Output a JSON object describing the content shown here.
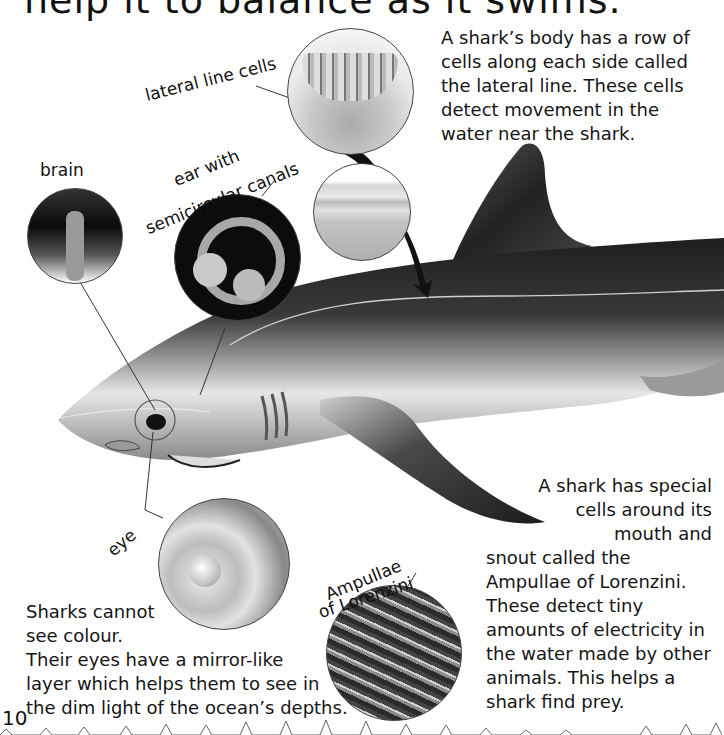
{
  "page": {
    "heading_partial": "help it to balance as it swims.",
    "page_number": "10"
  },
  "paragraphs": {
    "lateral_line": "A shark’s body has a row of\ncells along each side called\nthe lateral line. These cells\ndetect movement in the\nwater near the shark.",
    "ampullae_top": "A shark has special\ncells around its\nmouth and",
    "ampullae_bottom": "snout called the\nAmpullae of Lorenzini.\nThese detect tiny\namounts of electricity in\nthe water made by other\nanimals. This helps a\nshark find prey.",
    "eyes": "Sharks cannot\nsee colour.\nTheir eyes have a mirror-like\nlayer which helps them to see in\nthe dim light of the ocean’s depths."
  },
  "labels": {
    "lateral_line_cells": "lateral line cells",
    "brain": "brain",
    "ear_line1": "ear with",
    "ear_line2": "semicircular canals",
    "eye": "eye",
    "ampullae_line1": "Ampullae",
    "ampullae_line2": "of Lorenzini"
  },
  "illustrations": [
    {
      "name": "shark-body",
      "subject": "shark side view"
    },
    {
      "name": "lateral-line-cells-circle",
      "subject": "lateral line cells"
    },
    {
      "name": "lateral-line-skin-circle",
      "subject": "lateral line skin section"
    },
    {
      "name": "brain-circle",
      "subject": "brain"
    },
    {
      "name": "ear-circle",
      "subject": "ear with semicircular canals"
    },
    {
      "name": "eye-circle",
      "subject": "eye"
    },
    {
      "name": "ampullae-circle",
      "subject": "Ampullae of Lorenzini"
    }
  ],
  "colors": {
    "ink": "#111111",
    "shark_dark": "#2a2a2a",
    "shark_mid": "#7a7a7a",
    "shark_light": "#d8d8d8",
    "background": "#ffffff"
  }
}
